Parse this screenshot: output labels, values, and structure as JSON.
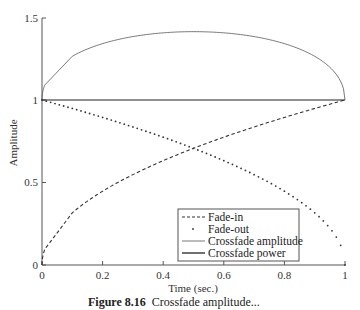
{
  "chart_data": {
    "type": "line",
    "title": "",
    "xlabel": "Time (sec.)",
    "ylabel": "Amplitude",
    "xlim": [
      0,
      1
    ],
    "ylim": [
      0,
      1.5
    ],
    "grid": false,
    "legend_position": "lower center-right (boxed)",
    "x_ticks": [
      "0",
      "0.2",
      "0.4",
      "0.6",
      "0.8",
      "1"
    ],
    "y_ticks": [
      "0",
      "0.5",
      "1",
      "1.5"
    ],
    "x": [
      0,
      0.05,
      0.1,
      0.15,
      0.2,
      0.25,
      0.3,
      0.35,
      0.4,
      0.45,
      0.5,
      0.55,
      0.6,
      0.65,
      0.7,
      0.75,
      0.8,
      0.85,
      0.9,
      0.95,
      1.0
    ],
    "series": [
      {
        "name": "Fade-in",
        "style": "dashed",
        "values": [
          0,
          0.224,
          0.316,
          0.387,
          0.447,
          0.5,
          0.548,
          0.592,
          0.632,
          0.671,
          0.707,
          0.742,
          0.775,
          0.806,
          0.837,
          0.866,
          0.894,
          0.922,
          0.949,
          0.975,
          1.0
        ]
      },
      {
        "name": "Fade-out",
        "style": "dotted",
        "values": [
          1.0,
          0.975,
          0.949,
          0.922,
          0.894,
          0.866,
          0.837,
          0.806,
          0.775,
          0.742,
          0.707,
          0.671,
          0.632,
          0.592,
          0.548,
          0.5,
          0.447,
          0.387,
          0.316,
          0.224,
          0
        ]
      },
      {
        "name": "Crossfade amplitude",
        "style": "solid-thin",
        "values": [
          1.0,
          1.199,
          1.265,
          1.309,
          1.342,
          1.366,
          1.385,
          1.398,
          1.407,
          1.413,
          1.414,
          1.413,
          1.407,
          1.398,
          1.385,
          1.366,
          1.342,
          1.309,
          1.265,
          1.199,
          1.0
        ]
      },
      {
        "name": "Crossfade power",
        "style": "solid",
        "values": [
          1,
          1,
          1,
          1,
          1,
          1,
          1,
          1,
          1,
          1,
          1,
          1,
          1,
          1,
          1,
          1,
          1,
          1,
          1,
          1,
          1
        ]
      }
    ]
  },
  "axes": {
    "xlabel": "Time (sec.)",
    "ylabel": "Amplitude",
    "x_ticks": [
      "0",
      "0.2",
      "0.4",
      "0.6",
      "0.8",
      "1"
    ],
    "y_ticks": [
      "0",
      "0.5",
      "1",
      "1.5"
    ]
  },
  "legend": {
    "items": [
      {
        "label": "Fade-in"
      },
      {
        "label": "Fade-out"
      },
      {
        "label": "Crossfade amplitude"
      },
      {
        "label": "Crossfade power"
      }
    ]
  },
  "caption": {
    "figure_number": "Figure 8.16",
    "text": "Crossfade amplitude..."
  },
  "colors": {
    "line": "#333333",
    "axis": "#555555"
  }
}
